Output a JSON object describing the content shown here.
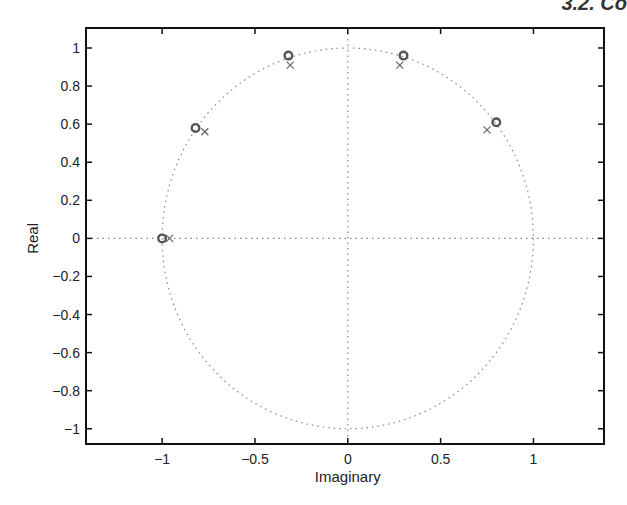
{
  "page_header": "3.2. Co",
  "chart_data": {
    "type": "scatter",
    "title": "",
    "xlabel": "Imaginary",
    "ylabel": "Real",
    "xlim": [
      -1.41,
      1.38
    ],
    "ylim": [
      -1.08,
      1.105
    ],
    "xticks": [
      -1,
      -0.5,
      0,
      0.5,
      1
    ],
    "xtick_labels": [
      "−1",
      "−0.5",
      "0",
      "0.5",
      "1"
    ],
    "yticks": [
      1,
      0.8,
      0.6,
      0.4,
      0.2,
      0,
      -0.2,
      -0.4,
      -0.6,
      -0.8,
      -1
    ],
    "ytick_labels": [
      "1",
      "0.8",
      "0.6",
      "0.4",
      "0.2",
      "0",
      "−0.2",
      "−0.4",
      "−0.6",
      "−0.8",
      "−1"
    ],
    "grid": false,
    "legend": null,
    "reference": {
      "unit_circle": {
        "radius": 1,
        "style": "dotted"
      },
      "axes_lines": {
        "style": "dotted"
      }
    },
    "series": [
      {
        "name": "zeros",
        "marker": "o",
        "points": [
          {
            "x": -1.0,
            "y": 0.0
          },
          {
            "x": -0.82,
            "y": 0.58
          },
          {
            "x": -0.32,
            "y": 0.96
          },
          {
            "x": 0.3,
            "y": 0.96
          },
          {
            "x": 0.8,
            "y": 0.61
          }
        ]
      },
      {
        "name": "poles",
        "marker": "x",
        "points": [
          {
            "x": -0.96,
            "y": 0.0
          },
          {
            "x": -0.77,
            "y": 0.56
          },
          {
            "x": -0.31,
            "y": 0.91
          },
          {
            "x": 0.28,
            "y": 0.91
          },
          {
            "x": 0.75,
            "y": 0.57
          }
        ]
      }
    ]
  }
}
